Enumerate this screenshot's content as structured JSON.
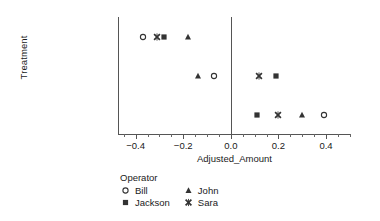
{
  "chart_data": {
    "type": "scatter",
    "title": "",
    "xlabel": "Adjusted_Amount",
    "ylabel": "Treatment",
    "xlim": [
      -0.47,
      0.505
    ],
    "ylim_categories": [
      "Drop",
      "Handheld Rotary",
      "Push Rotary"
    ],
    "grid": false,
    "legend_position": "below-axes-left",
    "legend_title": "Operator",
    "reference_line_x": 0.0,
    "xticks": [
      -0.4,
      -0.2,
      0.0,
      0.2,
      0.4
    ],
    "xticklabels": [
      "−0.4",
      "−0.2",
      "0.0",
      "0.2",
      "0.4"
    ],
    "xticks_minor": [
      -0.45,
      -0.35,
      -0.3,
      -0.25,
      -0.15,
      -0.1,
      -0.05,
      0.05,
      0.1,
      0.15,
      0.25,
      0.3,
      0.35,
      0.45,
      0.5
    ],
    "categories": [
      "Drop",
      "Handheld Rotary",
      "Push Rotary"
    ],
    "series": [
      {
        "name": "Bill",
        "marker": "circle-open",
        "values": [
          -0.37,
          -0.07,
          0.39
        ],
        "points": [
          {
            "category": "Drop",
            "x": -0.37
          },
          {
            "category": "Handheld Rotary",
            "x": -0.07
          },
          {
            "category": "Push Rotary",
            "x": 0.39
          }
        ]
      },
      {
        "name": "John",
        "marker": "triangle-filled",
        "values": [
          -0.18,
          -0.14,
          0.3
        ],
        "points": [
          {
            "category": "Drop",
            "x": -0.18
          },
          {
            "category": "Handheld Rotary",
            "x": -0.14
          },
          {
            "category": "Push Rotary",
            "x": 0.3
          }
        ]
      },
      {
        "name": "Jackson",
        "marker": "square-filled",
        "values": [
          -0.28,
          0.19,
          0.11
        ],
        "points": [
          {
            "category": "Drop",
            "x": -0.28
          },
          {
            "category": "Handheld Rotary",
            "x": 0.19
          },
          {
            "category": "Push Rotary",
            "x": 0.11
          }
        ]
      },
      {
        "name": "Sara",
        "marker": "x-filled",
        "values": [
          -0.31,
          0.12,
          0.2
        ],
        "points": [
          {
            "category": "Drop",
            "x": -0.31
          },
          {
            "category": "Handheld Rotary",
            "x": 0.12
          },
          {
            "category": "Push Rotary",
            "x": 0.2
          }
        ]
      }
    ],
    "colors": {
      "marker": "#333333",
      "axis": "#555555",
      "text": "#1a1a1a",
      "background": "#ffffff"
    }
  },
  "axes": {
    "y_title": "Treatment",
    "x_title": "Adjusted_Amount",
    "y_categories": [
      "Drop",
      "Handheld Rotary",
      "Push Rotary"
    ],
    "x_tick_labels": [
      "−0.4",
      "−0.2",
      "0.0",
      "0.2",
      "0.4"
    ]
  },
  "legend": {
    "title": "Operator",
    "entries": [
      {
        "label": "Bill",
        "marker": "circle-open"
      },
      {
        "label": "John",
        "marker": "triangle-filled"
      },
      {
        "label": "Jackson",
        "marker": "square-filled"
      },
      {
        "label": "Sara",
        "marker": "x-filled"
      }
    ]
  }
}
